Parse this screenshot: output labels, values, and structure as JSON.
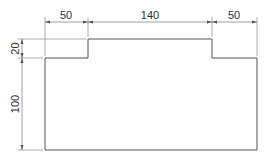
{
  "drawing": {
    "title": "Stepped profile dimension drawing",
    "line_color": "#555555",
    "dim_color": "#777777",
    "dimensions": {
      "top_left_width": "50",
      "top_middle_width": "140",
      "top_right_width": "50",
      "left_step_height": "20",
      "left_body_height": "100"
    }
  }
}
